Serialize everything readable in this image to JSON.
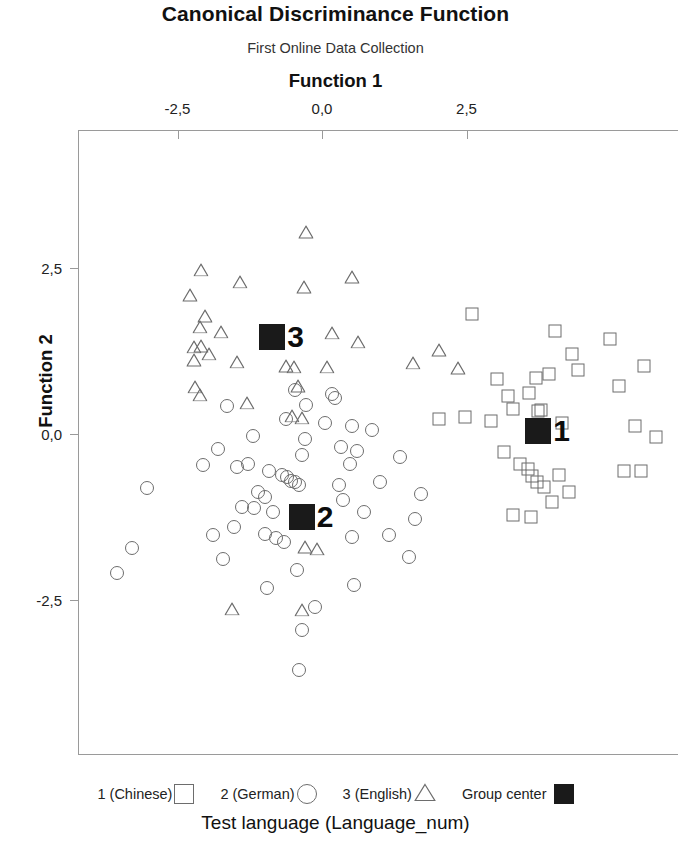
{
  "header": {
    "title": "Canonical Discriminance Function",
    "subtitle": "First Online Data Collection"
  },
  "footer": {
    "caption": "Test language (Language_num)"
  },
  "legend": {
    "items": [
      {
        "label": "1 (Chinese)",
        "marker": "square-marker"
      },
      {
        "label": "2 (German)",
        "marker": "circle-marker"
      },
      {
        "label": "3 (English)",
        "marker": "triangle-marker"
      },
      {
        "label": "Group center",
        "marker": "filled-square-marker"
      }
    ]
  },
  "chart_data": {
    "type": "scatter",
    "title": "Canonical Discriminance Function",
    "subtitle": "First Online Data Collection",
    "xlabel": "Function 1",
    "ylabel": "Function 2",
    "legend_title": "Test language (Language_num)",
    "legend_position": "bottom",
    "grid": false,
    "decimal_separator": ",",
    "xlim": [
      -4.2,
      6.0
    ],
    "ylim": [
      -4.6,
      3.5
    ],
    "xticks": [
      -2.5,
      0.0,
      2.5
    ],
    "xticklabels": [
      "-2,5",
      "0,0",
      "2,5"
    ],
    "yticks": [
      2.5,
      0.0,
      -2.5
    ],
    "yticklabels": [
      "2,5",
      "0,0",
      "-2,5"
    ],
    "series": [
      {
        "name": "1 (Chinese)",
        "marker": "square",
        "filled": false,
        "points": [
          [
            2.6,
            1.81
          ],
          [
            4.03,
            1.55
          ],
          [
            4.32,
            1.21
          ],
          [
            4.98,
            1.43
          ],
          [
            5.57,
            1.02
          ],
          [
            3.03,
            0.83
          ],
          [
            3.71,
            0.84
          ],
          [
            3.93,
            0.9
          ],
          [
            4.43,
            0.96
          ],
          [
            5.14,
            0.73
          ],
          [
            3.21,
            0.57
          ],
          [
            3.58,
            0.62
          ],
          [
            3.73,
            0.35
          ],
          [
            3.79,
            0.36
          ],
          [
            2.03,
            0.22
          ],
          [
            2.47,
            0.25
          ],
          [
            2.93,
            0.2
          ],
          [
            4.15,
            0.17
          ],
          [
            5.42,
            0.12
          ],
          [
            5.78,
            -0.05
          ],
          [
            3.15,
            -0.27
          ],
          [
            3.42,
            -0.45
          ],
          [
            3.56,
            -0.52
          ],
          [
            3.63,
            -0.63
          ],
          [
            3.72,
            -0.72
          ],
          [
            3.84,
            -0.79
          ],
          [
            4.1,
            -0.62
          ],
          [
            4.27,
            -0.87
          ],
          [
            3.98,
            -1.02
          ],
          [
            3.3,
            -1.22
          ],
          [
            3.62,
            -1.25
          ],
          [
            5.22,
            -0.55
          ],
          [
            5.52,
            -0.56
          ],
          [
            3.31,
            0.37
          ]
        ]
      },
      {
        "name": "2 (German)",
        "marker": "circle",
        "filled": false,
        "points": [
          [
            -0.47,
            0.66
          ],
          [
            0.17,
            0.6
          ],
          [
            0.23,
            0.55
          ],
          [
            -1.65,
            0.42
          ],
          [
            -0.62,
            0.22
          ],
          [
            0.05,
            0.16
          ],
          [
            0.52,
            0.12
          ],
          [
            0.86,
            0.06
          ],
          [
            -1.2,
            -0.03
          ],
          [
            -0.3,
            -0.07
          ],
          [
            0.33,
            -0.2
          ],
          [
            0.61,
            -0.26
          ],
          [
            -0.35,
            -0.31
          ],
          [
            1.35,
            -0.34
          ],
          [
            -2.06,
            -0.46
          ],
          [
            -1.47,
            -0.5
          ],
          [
            -0.92,
            -0.56
          ],
          [
            -0.7,
            -0.61
          ],
          [
            -0.6,
            -0.65
          ],
          [
            -0.53,
            -0.7
          ],
          [
            -0.47,
            -0.72
          ],
          [
            -0.4,
            -0.76
          ],
          [
            0.3,
            -0.77
          ],
          [
            1.01,
            -0.72
          ],
          [
            -3.02,
            -0.82
          ],
          [
            -1.1,
            -0.88
          ],
          [
            -0.98,
            -0.95
          ],
          [
            0.36,
            -0.99
          ],
          [
            1.72,
            -0.9
          ],
          [
            -1.38,
            -1.1
          ],
          [
            -1.18,
            -1.12
          ],
          [
            -0.85,
            -1.17
          ],
          [
            0.72,
            -1.18
          ],
          [
            1.6,
            -1.28
          ],
          [
            -1.52,
            -1.4
          ],
          [
            -1.88,
            -1.52
          ],
          [
            -0.98,
            -1.5
          ],
          [
            -0.8,
            -1.56
          ],
          [
            -0.66,
            -1.62
          ],
          [
            0.52,
            -1.55
          ],
          [
            -3.28,
            -1.72
          ],
          [
            -1.72,
            -1.88
          ],
          [
            1.5,
            -1.85
          ],
          [
            -0.43,
            -2.04
          ],
          [
            -3.55,
            -2.1
          ],
          [
            -0.95,
            -2.32
          ],
          [
            0.55,
            -2.28
          ],
          [
            -0.12,
            -2.6
          ],
          [
            -0.35,
            -2.95
          ],
          [
            -0.4,
            -3.55
          ],
          [
            -0.28,
            0.44
          ],
          [
            0.48,
            -0.45
          ],
          [
            -1.28,
            -0.45
          ],
          [
            -1.8,
            -0.22
          ],
          [
            1.15,
            -1.52
          ]
        ]
      },
      {
        "name": "3 (English)",
        "marker": "triangle",
        "filled": false,
        "points": [
          [
            -0.28,
            3.05
          ],
          [
            -2.1,
            2.48
          ],
          [
            -1.42,
            2.3
          ],
          [
            -0.32,
            2.22
          ],
          [
            0.52,
            2.37
          ],
          [
            -2.28,
            2.1
          ],
          [
            -2.02,
            1.78
          ],
          [
            -2.12,
            1.62
          ],
          [
            -1.75,
            1.55
          ],
          [
            0.18,
            1.53
          ],
          [
            0.62,
            1.4
          ],
          [
            -2.22,
            1.32
          ],
          [
            -2.1,
            1.33
          ],
          [
            -1.95,
            1.22
          ],
          [
            -2.22,
            1.12
          ],
          [
            -1.48,
            1.1
          ],
          [
            -0.62,
            1.03
          ],
          [
            -0.48,
            1.02
          ],
          [
            0.08,
            1.02
          ],
          [
            1.58,
            1.08
          ],
          [
            2.02,
            1.27
          ],
          [
            -0.42,
            0.73
          ],
          [
            -2.2,
            0.72
          ],
          [
            -2.12,
            0.6
          ],
          [
            -1.3,
            0.48
          ],
          [
            -0.52,
            0.28
          ],
          [
            -0.35,
            0.25
          ],
          [
            -1.55,
            -2.62
          ],
          [
            -0.3,
            -1.7
          ],
          [
            -0.08,
            -1.72
          ],
          [
            -0.35,
            -2.64
          ],
          [
            2.35,
            1.0
          ]
        ]
      },
      {
        "name": "Group center",
        "marker": "filled-square",
        "filled": true,
        "points": [
          [
            3.74,
            0.05
          ],
          [
            -0.35,
            -1.25
          ],
          [
            -0.86,
            1.46
          ]
        ],
        "labels": [
          "1",
          "2",
          "3"
        ]
      }
    ]
  }
}
